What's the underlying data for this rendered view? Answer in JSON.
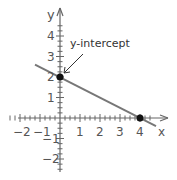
{
  "chart_data": {
    "type": "line",
    "title": "",
    "xlabel": "x",
    "ylabel": "y",
    "xlim": [
      -2.5,
      4.8
    ],
    "ylim": [
      -2.6,
      5.0
    ],
    "x_ticks": [
      -2,
      -1,
      1,
      2,
      3,
      4
    ],
    "y_ticks": [
      -2,
      -1,
      1,
      2,
      3,
      4
    ],
    "x_tick_labels": [
      "−2",
      "−1",
      "1",
      "2",
      "3",
      "4"
    ],
    "y_tick_labels": [
      "−2",
      "−1",
      "1",
      "2",
      "3",
      "4"
    ],
    "minor_tick_step": 0.25,
    "grid": false,
    "series": [
      {
        "name": "line",
        "x": [
          -1.25,
          4.8
        ],
        "y": [
          2.6,
          -0.4
        ],
        "equation": "y = -0.5x + 2",
        "color": "#777777"
      }
    ],
    "points": [
      {
        "x": 0,
        "y": 2,
        "label": "y-intercept"
      },
      {
        "x": 4,
        "y": 0,
        "label": ""
      }
    ],
    "annotations": [
      {
        "text": "y-intercept",
        "target": {
          "x": 0,
          "y": 2
        }
      }
    ]
  },
  "labels": {
    "x_axis": "x",
    "y_axis": "y",
    "annotation": "y-intercept"
  },
  "colors": {
    "axis": "#666666",
    "line": "#777777",
    "point": "#111111",
    "text": "#555555"
  }
}
